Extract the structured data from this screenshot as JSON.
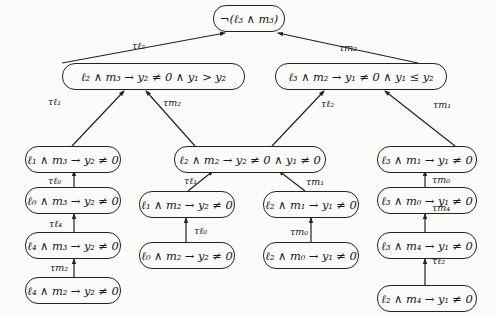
{
  "diagram": {
    "type": "tree",
    "direction": "bottom-up",
    "nodes": [
      {
        "id": "root",
        "label": "¬(ℓ₃ ∧ m₃)"
      },
      {
        "id": "n1",
        "label": "ℓ₂ ∧ m₃ → y₂ ≠ 0 ∧ y₁ > y₂"
      },
      {
        "id": "n2",
        "label": "ℓ₃ ∧ m₂ → y₁ ≠ 0 ∧ y₁ ≤ y₂"
      },
      {
        "id": "n3",
        "label": "ℓ₁ ∧ m₃ → y₂ ≠ 0"
      },
      {
        "id": "n4",
        "label": "ℓ₂ ∧ m₂ → y₂ ≠ 0 ∧ y₁ ≠ 0"
      },
      {
        "id": "n5",
        "label": "ℓ₃ ∧ m₁ → y₁ ≠ 0"
      },
      {
        "id": "n6",
        "label": "ℓ₀ ∧ m₃ → y₂ ≠ 0"
      },
      {
        "id": "n7",
        "label": "ℓ₁ ∧ m₂ → y₂ ≠ 0"
      },
      {
        "id": "n8",
        "label": "ℓ₂ ∧ m₁ → y₁ ≠ 0"
      },
      {
        "id": "n9",
        "label": "ℓ₃ ∧ m₀ → y₁ ≠ 0"
      },
      {
        "id": "n10",
        "label": "ℓ₄ ∧ m₃ → y₂ ≠ 0"
      },
      {
        "id": "n11",
        "label": "ℓ₀ ∧ m₂ → y₂ ≠ 0"
      },
      {
        "id": "n12",
        "label": "ℓ₂ ∧ m₀ → y₁ ≠ 0"
      },
      {
        "id": "n13",
        "label": "ℓ₃ ∧ m₄ → y₁ ≠ 0"
      },
      {
        "id": "n14",
        "label": "ℓ₄ ∧ m₂ → y₂ ≠ 0"
      },
      {
        "id": "n15",
        "label": "ℓ₂ ∧ m₄ → y₁ ≠ 0"
      }
    ],
    "edges": [
      {
        "from": "n1",
        "to": "root",
        "label": "τℓ₂"
      },
      {
        "from": "n2",
        "to": "root",
        "label": "τm₂"
      },
      {
        "from": "n3",
        "to": "n1",
        "label": "τℓ₁"
      },
      {
        "from": "n4",
        "to": "n1",
        "label": "τm₂"
      },
      {
        "from": "n4",
        "to": "n2",
        "label": "τℓ₂"
      },
      {
        "from": "n5",
        "to": "n2",
        "label": "τm₁"
      },
      {
        "from": "n6",
        "to": "n3",
        "label": "τℓ₀"
      },
      {
        "from": "n7",
        "to": "n4",
        "label": "τℓ₁"
      },
      {
        "from": "n8",
        "to": "n4",
        "label": "τm₁"
      },
      {
        "from": "n9",
        "to": "n5",
        "label": "τm₀"
      },
      {
        "from": "n10",
        "to": "n6",
        "label": "τℓ₄"
      },
      {
        "from": "n11",
        "to": "n7",
        "label": "τℓ₀"
      },
      {
        "from": "n12",
        "to": "n8",
        "label": "τm₀"
      },
      {
        "from": "n13",
        "to": "n9",
        "label": "τm₄"
      },
      {
        "from": "n14",
        "to": "n10",
        "label": "τm₂"
      },
      {
        "from": "n15",
        "to": "n13",
        "label": "τℓ₂"
      }
    ]
  }
}
